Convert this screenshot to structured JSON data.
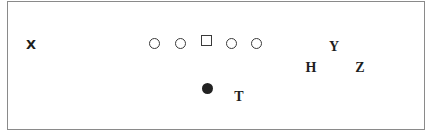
{
  "diagram": {
    "type": "football-formation",
    "defense": [
      {
        "id": "x",
        "label": "X",
        "style": "sans"
      }
    ],
    "offensive_line": [
      {
        "shape": "circle"
      },
      {
        "shape": "circle"
      },
      {
        "shape": "square",
        "role": "center"
      },
      {
        "shape": "circle"
      },
      {
        "shape": "circle"
      }
    ],
    "backfield": [
      {
        "shape": "filled-circle",
        "role": "quarterback"
      }
    ],
    "skill_players": [
      {
        "id": "t",
        "label": "T"
      },
      {
        "id": "y",
        "label": "Y"
      },
      {
        "id": "h",
        "label": "H"
      },
      {
        "id": "z",
        "label": "Z"
      }
    ],
    "colors": {
      "stroke": "#3a3a3a",
      "fill": "#222222",
      "border": "#8a8a8a",
      "background": "#ffffff"
    }
  }
}
